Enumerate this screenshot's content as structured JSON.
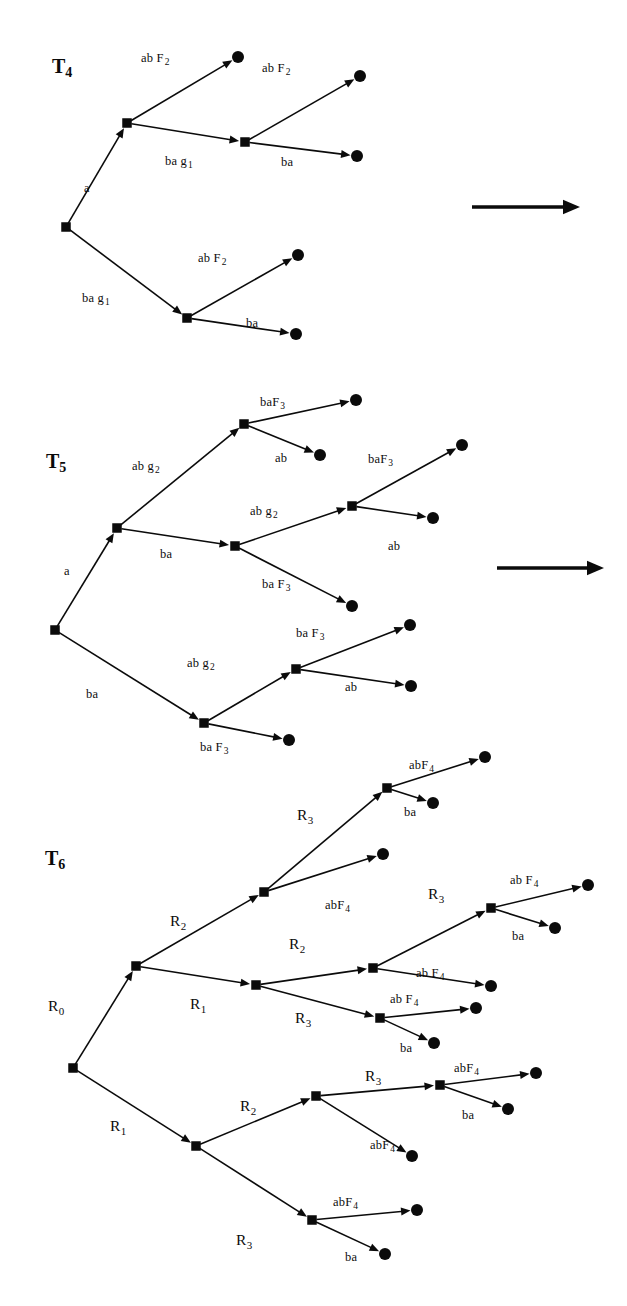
{
  "figure": {
    "background": "#ffffff",
    "ink": "#0b0b0b",
    "node_shape": "filled-square",
    "leaf_shape": "filled-circle"
  },
  "trees": [
    {
      "id": "T4",
      "name": "T",
      "subscript": "4",
      "label_x": 52,
      "label_y": 56,
      "nodes": [
        {
          "name": "root",
          "type": "square",
          "x": 66,
          "y": 227
        },
        {
          "name": "n-a",
          "type": "square",
          "x": 127,
          "y": 123
        },
        {
          "name": "n-a-ba",
          "type": "square",
          "x": 245,
          "y": 142
        },
        {
          "name": "n-ba",
          "type": "square",
          "x": 187,
          "y": 318
        },
        {
          "name": "leaf-1",
          "type": "circle",
          "x": 238,
          "y": 57
        },
        {
          "name": "leaf-2",
          "type": "circle",
          "x": 360,
          "y": 76
        },
        {
          "name": "leaf-3",
          "type": "circle",
          "x": 357,
          "y": 156
        },
        {
          "name": "leaf-4",
          "type": "circle",
          "x": 298,
          "y": 255
        },
        {
          "name": "leaf-5",
          "type": "circle",
          "x": 296,
          "y": 334
        }
      ],
      "edges": [
        {
          "from": "root",
          "to": "n-a",
          "label": "a",
          "sub": "",
          "lx": 84,
          "ly": 182,
          "arrow": true
        },
        {
          "from": "root",
          "to": "n-ba",
          "label": "ba g",
          "sub": "1",
          "lx": 82,
          "ly": 292,
          "arrow": true
        },
        {
          "from": "n-a",
          "to": "leaf-1",
          "label": "ab F",
          "sub": "2",
          "lx": 141,
          "ly": 52,
          "arrow": true
        },
        {
          "from": "n-a",
          "to": "n-a-ba",
          "label": "ba g",
          "sub": "1",
          "lx": 165,
          "ly": 155,
          "arrow": true
        },
        {
          "from": "n-a-ba",
          "to": "leaf-2",
          "label": "ab F",
          "sub": "2",
          "lx": 262,
          "ly": 62,
          "arrow": true
        },
        {
          "from": "n-a-ba",
          "to": "leaf-3",
          "label": "ba",
          "sub": "",
          "lx": 281,
          "ly": 156,
          "arrow": true
        },
        {
          "from": "n-ba",
          "to": "leaf-4",
          "label": "ab F",
          "sub": "2",
          "lx": 198,
          "ly": 252,
          "arrow": true
        },
        {
          "from": "n-ba",
          "to": "leaf-5",
          "label": "ba",
          "sub": "",
          "lx": 246,
          "ly": 317,
          "arrow": true
        }
      ],
      "side_arrow": {
        "name": "transition-arrow-1",
        "x1": 472,
        "y1": 207,
        "x2": 580,
        "y2": 207
      }
    },
    {
      "id": "T5",
      "name": "T",
      "subscript": "5",
      "label_x": 46,
      "label_y": 451,
      "nodes": [
        {
          "name": "root",
          "type": "square",
          "x": 55,
          "y": 630
        },
        {
          "name": "n-a",
          "type": "square",
          "x": 117,
          "y": 528
        },
        {
          "name": "n-a-ab",
          "type": "square",
          "x": 244,
          "y": 424
        },
        {
          "name": "n-a-ba",
          "type": "square",
          "x": 235,
          "y": 546
        },
        {
          "name": "n-a-ba-ab",
          "type": "square",
          "x": 352,
          "y": 506
        },
        {
          "name": "n-ba",
          "type": "square",
          "x": 204,
          "y": 723
        },
        {
          "name": "n-ba-ab",
          "type": "square",
          "x": 296,
          "y": 669
        },
        {
          "name": "leaf-1",
          "type": "circle",
          "x": 356,
          "y": 400
        },
        {
          "name": "leaf-2",
          "type": "circle",
          "x": 320,
          "y": 455
        },
        {
          "name": "leaf-3",
          "type": "circle",
          "x": 462,
          "y": 445
        },
        {
          "name": "leaf-4",
          "type": "circle",
          "x": 433,
          "y": 518
        },
        {
          "name": "leaf-5",
          "type": "circle",
          "x": 352,
          "y": 606
        },
        {
          "name": "leaf-6",
          "type": "circle",
          "x": 410,
          "y": 625
        },
        {
          "name": "leaf-7",
          "type": "circle",
          "x": 411,
          "y": 686
        },
        {
          "name": "leaf-8",
          "type": "circle",
          "x": 289,
          "y": 740
        }
      ],
      "edges": [
        {
          "from": "root",
          "to": "n-a",
          "label": "a",
          "sub": "",
          "lx": 64,
          "ly": 565,
          "arrow": true
        },
        {
          "from": "root",
          "to": "n-ba",
          "label": "ba",
          "sub": "",
          "lx": 86,
          "ly": 688,
          "arrow": true
        },
        {
          "from": "n-a",
          "to": "n-a-ab",
          "label": "ab g",
          "sub": "2",
          "lx": 132,
          "ly": 460,
          "arrow": true
        },
        {
          "from": "n-a",
          "to": "n-a-ba",
          "label": "ba",
          "sub": "",
          "lx": 160,
          "ly": 548,
          "arrow": true
        },
        {
          "from": "n-a-ab",
          "to": "leaf-1",
          "label": "baF",
          "sub": "3",
          "lx": 260,
          "ly": 396,
          "arrow": true
        },
        {
          "from": "n-a-ab",
          "to": "leaf-2",
          "label": "ab",
          "sub": "",
          "lx": 275,
          "ly": 452,
          "arrow": true
        },
        {
          "from": "n-a-ba",
          "to": "n-a-ba-ab",
          "label": "ab g",
          "sub": "2",
          "lx": 250,
          "ly": 505,
          "arrow": true
        },
        {
          "from": "n-a-ba",
          "to": "leaf-5",
          "label": "ba F",
          "sub": "3",
          "lx": 262,
          "ly": 578,
          "arrow": true
        },
        {
          "from": "n-a-ba-ab",
          "to": "leaf-3",
          "label": "baF",
          "sub": "3",
          "lx": 368,
          "ly": 453,
          "arrow": true
        },
        {
          "from": "n-a-ba-ab",
          "to": "leaf-4",
          "label": "ab",
          "sub": "",
          "lx": 388,
          "ly": 540,
          "arrow": true
        },
        {
          "from": "n-ba",
          "to": "n-ba-ab",
          "label": "ab g",
          "sub": "2",
          "lx": 187,
          "ly": 657,
          "arrow": true
        },
        {
          "from": "n-ba",
          "to": "leaf-8",
          "label": "ba F",
          "sub": "3",
          "lx": 200,
          "ly": 741,
          "arrow": true
        },
        {
          "from": "n-ba-ab",
          "to": "leaf-6",
          "label": "ba F",
          "sub": "3",
          "lx": 296,
          "ly": 627,
          "arrow": true
        },
        {
          "from": "n-ba-ab",
          "to": "leaf-7",
          "label": "ab",
          "sub": "",
          "lx": 345,
          "ly": 681,
          "arrow": true
        }
      ],
      "side_arrow": {
        "name": "transition-arrow-2",
        "x1": 497,
        "y1": 568,
        "x2": 604,
        "y2": 568
      }
    },
    {
      "id": "T6",
      "name": "T",
      "subscript": "6",
      "label_x": 45,
      "label_y": 848,
      "nodes": [
        {
          "name": "root",
          "type": "square",
          "x": 73,
          "y": 1068
        },
        {
          "name": "n-r0",
          "type": "square",
          "x": 136,
          "y": 966
        },
        {
          "name": "n-r0-r2",
          "type": "square",
          "x": 264,
          "y": 892
        },
        {
          "name": "n-r0-r2-r3",
          "type": "square",
          "x": 387,
          "y": 788
        },
        {
          "name": "n-r0-r1",
          "type": "square",
          "x": 256,
          "y": 985
        },
        {
          "name": "n-r0-r1-r2",
          "type": "square",
          "x": 373,
          "y": 968
        },
        {
          "name": "n-r0-r1-r2-r3",
          "type": "square",
          "x": 491,
          "y": 908
        },
        {
          "name": "n-r0-r1-r3",
          "type": "square",
          "x": 380,
          "y": 1018
        },
        {
          "name": "n-r1",
          "type": "square",
          "x": 196,
          "y": 1146
        },
        {
          "name": "n-r1-r2",
          "type": "square",
          "x": 316,
          "y": 1096
        },
        {
          "name": "n-r1-r2-r3",
          "type": "square",
          "x": 440,
          "y": 1085
        },
        {
          "name": "n-r1-r3",
          "type": "square",
          "x": 312,
          "y": 1220
        },
        {
          "name": "leaf-1",
          "type": "circle",
          "x": 485,
          "y": 757
        },
        {
          "name": "leaf-2",
          "type": "circle",
          "x": 433,
          "y": 803
        },
        {
          "name": "leaf-3",
          "type": "circle",
          "x": 383,
          "y": 854
        },
        {
          "name": "leaf-4",
          "type": "circle",
          "x": 588,
          "y": 885
        },
        {
          "name": "leaf-5",
          "type": "circle",
          "x": 555,
          "y": 928
        },
        {
          "name": "leaf-6",
          "type": "circle",
          "x": 491,
          "y": 986
        },
        {
          "name": "leaf-7",
          "type": "circle",
          "x": 476,
          "y": 1008
        },
        {
          "name": "leaf-8",
          "type": "circle",
          "x": 434,
          "y": 1043
        },
        {
          "name": "leaf-9",
          "type": "circle",
          "x": 536,
          "y": 1073
        },
        {
          "name": "leaf-10",
          "type": "circle",
          "x": 508,
          "y": 1109
        },
        {
          "name": "leaf-11",
          "type": "circle",
          "x": 412,
          "y": 1156
        },
        {
          "name": "leaf-12",
          "type": "circle",
          "x": 417,
          "y": 1210
        },
        {
          "name": "leaf-13",
          "type": "circle",
          "x": 385,
          "y": 1254
        }
      ],
      "edges": [
        {
          "from": "root",
          "to": "n-r0",
          "label": "R",
          "sub": "0",
          "lx": 48,
          "ly": 998,
          "arrow": true
        },
        {
          "from": "root",
          "to": "n-r1",
          "label": "R",
          "sub": "1",
          "lx": 110,
          "ly": 1118,
          "arrow": true
        },
        {
          "from": "n-r0",
          "to": "n-r0-r2",
          "label": "R",
          "sub": "2",
          "lx": 170,
          "ly": 913,
          "arrow": true
        },
        {
          "from": "n-r0",
          "to": "n-r0-r1",
          "label": "R",
          "sub": "1",
          "lx": 190,
          "ly": 996,
          "arrow": true
        },
        {
          "from": "n-r0-r2",
          "to": "n-r0-r2-r3",
          "label": "R",
          "sub": "3",
          "lx": 297,
          "ly": 807,
          "arrow": true
        },
        {
          "from": "n-r0-r2",
          "to": "leaf-3",
          "label": "abF",
          "sub": "4",
          "lx": 325,
          "ly": 899,
          "arrow": true
        },
        {
          "from": "n-r0-r2-r3",
          "to": "leaf-1",
          "label": "abF",
          "sub": "4",
          "lx": 409,
          "ly": 759,
          "arrow": true
        },
        {
          "from": "n-r0-r2-r3",
          "to": "leaf-2",
          "label": "ba",
          "sub": "",
          "lx": 404,
          "ly": 806,
          "arrow": true
        },
        {
          "from": "n-r0-r1",
          "to": "n-r0-r1-r2",
          "label": "R",
          "sub": "2",
          "lx": 289,
          "ly": 936,
          "arrow": true
        },
        {
          "from": "n-r0-r1",
          "to": "n-r0-r1-r3",
          "label": "R",
          "sub": "3",
          "lx": 295,
          "ly": 1010,
          "arrow": true
        },
        {
          "from": "n-r0-r1-r2",
          "to": "n-r0-r1-r2-r3",
          "label": "R",
          "sub": "3",
          "lx": 428,
          "ly": 886,
          "arrow": true
        },
        {
          "from": "n-r0-r1-r2",
          "to": "leaf-6",
          "label": "ab F",
          "sub": "4",
          "lx": 416,
          "ly": 967,
          "arrow": true
        },
        {
          "from": "n-r0-r1-r2-r3",
          "to": "leaf-4",
          "label": "ab F",
          "sub": "4",
          "lx": 510,
          "ly": 874,
          "arrow": true
        },
        {
          "from": "n-r0-r1-r2-r3",
          "to": "leaf-5",
          "label": "ba",
          "sub": "",
          "lx": 512,
          "ly": 930,
          "arrow": true
        },
        {
          "from": "n-r0-r1-r3",
          "to": "leaf-7",
          "label": "ab F",
          "sub": "4",
          "lx": 390,
          "ly": 993,
          "arrow": true
        },
        {
          "from": "n-r0-r1-r3",
          "to": "leaf-8",
          "label": "ba",
          "sub": "",
          "lx": 400,
          "ly": 1042,
          "arrow": true
        },
        {
          "from": "n-r1",
          "to": "n-r1-r2",
          "label": "R",
          "sub": "2",
          "lx": 240,
          "ly": 1098,
          "arrow": true
        },
        {
          "from": "n-r1",
          "to": "n-r1-r3",
          "label": "R",
          "sub": "3",
          "lx": 236,
          "ly": 1232,
          "arrow": true
        },
        {
          "from": "n-r1-r2",
          "to": "n-r1-r2-r3",
          "label": "R",
          "sub": "3",
          "lx": 365,
          "ly": 1068,
          "arrow": true
        },
        {
          "from": "n-r1-r2",
          "to": "leaf-11",
          "label": "abF",
          "sub": "4",
          "lx": 370,
          "ly": 1139,
          "arrow": true
        },
        {
          "from": "n-r1-r2-r3",
          "to": "leaf-9",
          "label": "abF",
          "sub": "4",
          "lx": 454,
          "ly": 1062,
          "arrow": true
        },
        {
          "from": "n-r1-r2-r3",
          "to": "leaf-10",
          "label": "ba",
          "sub": "",
          "lx": 462,
          "ly": 1109,
          "arrow": true
        },
        {
          "from": "n-r1-r3",
          "to": "leaf-12",
          "label": "abF",
          "sub": "4",
          "lx": 333,
          "ly": 1196,
          "arrow": true
        },
        {
          "from": "n-r1-r3",
          "to": "leaf-13",
          "label": "ba",
          "sub": "",
          "lx": 345,
          "ly": 1251,
          "arrow": true
        }
      ],
      "side_arrow": null
    }
  ]
}
